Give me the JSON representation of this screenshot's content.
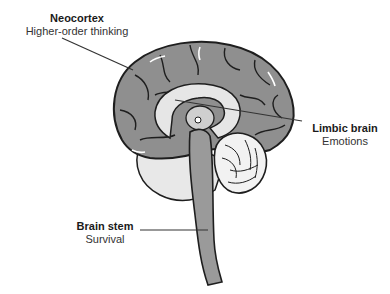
{
  "diagram": {
    "labels": [
      {
        "id": "neocortex",
        "title": "Neocortex",
        "subtitle": "Higher-order thinking"
      },
      {
        "id": "limbic",
        "title": "Limbic brain",
        "subtitle": "Emotions"
      },
      {
        "id": "brainstem",
        "title": "Brain stem",
        "subtitle": "Survival"
      }
    ],
    "colors": {
      "cortex_fill": "#8f8f8f",
      "light_fill": "#e6e6e6",
      "stem_fill": "#9a9a9a",
      "outline": "#1e1e1e",
      "leader_line": "#333333"
    }
  }
}
